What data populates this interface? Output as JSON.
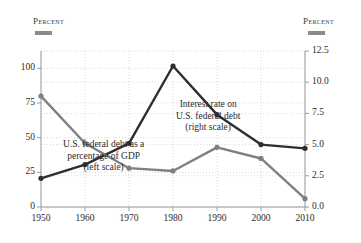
{
  "headers": {
    "left_label": "Percent",
    "right_label": "Percent"
  },
  "annotations": {
    "interest": {
      "line1": "Interest rate on",
      "line2": "U.S. federal debt",
      "line3": "(right scale)"
    },
    "debt": {
      "line1": "U.S. federal debt as a",
      "line2": "percentage of GDP",
      "line3": "(left scale)"
    }
  },
  "colors": {
    "interest_line": "#2e2e2e",
    "debt_line": "#808080",
    "grid": "#d9d9d9",
    "axis": "#9a9a9a",
    "text": "#2b2b2b",
    "swatch": "#8a8a8a"
  },
  "chart_data": {
    "type": "line",
    "title": "",
    "xlabel": "",
    "grid": true,
    "legend": "annotations",
    "x": [
      1950,
      1960,
      1970,
      1980,
      1990,
      2000,
      2010
    ],
    "xtick_labels": [
      "1950",
      "1960",
      "1970",
      "1980",
      "1990",
      "2000",
      "2010"
    ],
    "xlim": [
      1950,
      2010
    ],
    "left_axis": {
      "label": "Percent",
      "ylim": [
        0,
        112.5
      ],
      "ticks": [
        0,
        25,
        50,
        75,
        100
      ],
      "tick_labels": [
        "0",
        "25",
        "50",
        "75",
        "100"
      ]
    },
    "right_axis": {
      "label": "Percent",
      "ylim": [
        0.0,
        12.5
      ],
      "ticks": [
        0.0,
        2.5,
        5.0,
        7.5,
        10.0,
        12.5
      ],
      "tick_labels": [
        "0.0",
        "2.5",
        "5.0",
        "7.5",
        "10.0",
        "12.5"
      ]
    },
    "series": [
      {
        "name": "Interest rate on U.S. federal debt (right scale)",
        "axis": "right",
        "color": "#2e2e2e",
        "values": [
          2.3,
          3.4,
          5.1,
          11.3,
          7.4,
          5.0,
          4.7
        ]
      },
      {
        "name": "U.S. federal debt as a percentage of GDP (left scale)",
        "axis": "left",
        "color": "#808080",
        "values": [
          80,
          46,
          28,
          26,
          43,
          35,
          6
        ]
      }
    ]
  }
}
